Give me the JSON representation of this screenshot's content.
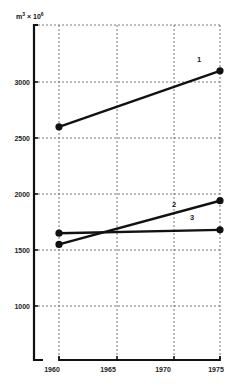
{
  "chart_data": {
    "type": "line",
    "title": "",
    "xlabel": "",
    "ylabel": "m³ × 10⁶",
    "x_ticks": [
      "1960",
      "1965",
      "1970",
      "1975"
    ],
    "y_ticks": [
      "1000",
      "1500",
      "2000",
      "2500",
      "3000"
    ],
    "xlim": [
      1958.5,
      1975.5
    ],
    "ylim": [
      520,
      3500
    ],
    "grid": true,
    "legend": "inline numeric labels",
    "series": [
      {
        "name": "1",
        "x": [
          1961,
          1975
        ],
        "values": [
          2600,
          3100
        ]
      },
      {
        "name": "2",
        "x": [
          1961,
          1975
        ],
        "values": [
          1550,
          1940
        ]
      },
      {
        "name": "3",
        "x": [
          1961,
          1975
        ],
        "values": [
          1650,
          1680
        ]
      }
    ]
  },
  "labels": {
    "unit_base": "m",
    "unit_exp": "3",
    "unit_mult": " × 10",
    "unit_mult_exp": "6"
  }
}
